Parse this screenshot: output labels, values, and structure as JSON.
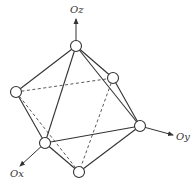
{
  "diagram": {
    "type": "octahedron-with-axes",
    "colors": {
      "stroke": "#333333",
      "background": "#ffffff"
    },
    "axes": [
      {
        "id": "oz",
        "label": "Oz",
        "from": [
          76,
          46
        ],
        "to": [
          76,
          19
        ],
        "label_pos": [
          70,
          13
        ]
      },
      {
        "id": "oy",
        "label": "Oy",
        "from": [
          140,
          126
        ],
        "to": [
          173,
          135
        ],
        "label_pos": [
          176,
          140
        ]
      },
      {
        "id": "ox",
        "label": "Ox",
        "from": [
          45,
          143
        ],
        "to": [
          20,
          166
        ],
        "label_pos": [
          10,
          177
        ]
      }
    ],
    "vertices": [
      {
        "id": "top",
        "pos": [
          76,
          46
        ]
      },
      {
        "id": "left",
        "pos": [
          16,
          92
        ]
      },
      {
        "id": "back-right",
        "pos": [
          113,
          78
        ]
      },
      {
        "id": "right",
        "pos": [
          140,
          126
        ]
      },
      {
        "id": "front",
        "pos": [
          45,
          143
        ]
      },
      {
        "id": "bottom",
        "pos": [
          79,
          172
        ]
      }
    ],
    "edges_solid": [
      [
        "top",
        "left"
      ],
      [
        "top",
        "front"
      ],
      [
        "top",
        "back-right"
      ],
      [
        "top",
        "right"
      ],
      [
        "left",
        "front"
      ],
      [
        "front",
        "right"
      ],
      [
        "front",
        "bottom"
      ],
      [
        "right",
        "bottom"
      ],
      [
        "back-right",
        "right"
      ]
    ],
    "edges_dashed": [
      [
        "left",
        "back-right"
      ],
      [
        "left",
        "bottom"
      ],
      [
        "back-right",
        "bottom"
      ]
    ],
    "vertex_radius": 5.5
  }
}
